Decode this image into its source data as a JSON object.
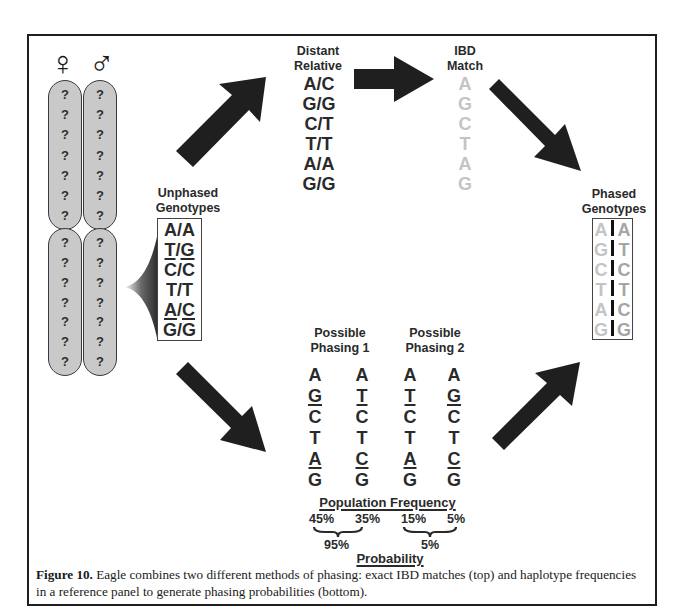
{
  "figure": {
    "caption_label": "Figure 10.",
    "caption_text": "Eagle combines two different methods of phasing: exact IBD matches (top) and haplotype frequencies in a reference panel to generate phasing probabilities (bottom).",
    "colors": {
      "arrow": "#1f1f1f",
      "chromosome_fill": "#c9c9c9",
      "ibd_allele": "#c4c4c4",
      "frequency_allele": "#a5a5a5",
      "text": "#2a2a2a"
    }
  },
  "chromosomes": {
    "female_symbol": "♀",
    "male_symbol": "♂",
    "unknown_marker": "?",
    "markers_per_segment": 7,
    "segments": 2
  },
  "unphased": {
    "title_line1": "Unphased",
    "title_line2": "Genotypes",
    "rows": [
      {
        "a": "A",
        "b": "A",
        "a_u": false,
        "b_u": false
      },
      {
        "a": "T",
        "b": "G",
        "a_u": true,
        "b_u": true
      },
      {
        "a": "C",
        "b": "C",
        "a_u": false,
        "b_u": false
      },
      {
        "a": "T",
        "b": "T",
        "a_u": false,
        "b_u": false
      },
      {
        "a": "A",
        "b": "C",
        "a_u": true,
        "b_u": true
      },
      {
        "a": "G",
        "b": "G",
        "a_u": false,
        "b_u": false
      }
    ]
  },
  "distant_relative": {
    "title_line1": "Distant",
    "title_line2": "Relative",
    "rows": [
      "A/C",
      "G/G",
      "C/T",
      "T/T",
      "A/A",
      "G/G"
    ]
  },
  "ibd_match": {
    "title_line1": "IBD",
    "title_line2": "Match",
    "alleles": [
      "A",
      "G",
      "C",
      "T",
      "A",
      "G"
    ]
  },
  "phased": {
    "title_line1": "Phased",
    "title_line2": "Genotypes",
    "rows": [
      {
        "left": "A",
        "right": "A"
      },
      {
        "left": "G",
        "right": "T"
      },
      {
        "left": "C",
        "right": "C"
      },
      {
        "left": "T",
        "right": "T"
      },
      {
        "left": "A",
        "right": "C"
      },
      {
        "left": "G",
        "right": "G"
      }
    ]
  },
  "phasing1": {
    "title_line1": "Possible",
    "title_line2": "Phasing 1",
    "hap1": [
      "A",
      "G",
      "C",
      "T",
      "A",
      "G"
    ],
    "hap2": [
      "A",
      "T",
      "C",
      "T",
      "C",
      "G"
    ],
    "hap1_freq": "45%",
    "hap2_freq": "35%",
    "probability": "95%"
  },
  "phasing2": {
    "title_line1": "Possible",
    "title_line2": "Phasing 2",
    "hap1": [
      "A",
      "T",
      "C",
      "T",
      "A",
      "G"
    ],
    "hap2": [
      "A",
      "G",
      "C",
      "T",
      "C",
      "G"
    ],
    "hap1_freq": "15%",
    "hap2_freq": "5%",
    "probability": "5%"
  },
  "labels": {
    "population_frequency": "Population Frequency",
    "probability": "Probability"
  }
}
